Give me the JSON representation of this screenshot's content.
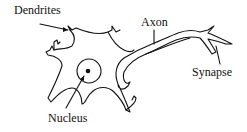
{
  "diagram": {
    "labels": {
      "dendrites": "Dendrites",
      "axon": "Axon",
      "synapse": "Synapse",
      "nucleus": "Nucleus"
    },
    "colors": {
      "stroke": "#111111",
      "background": "#ffffff"
    }
  }
}
